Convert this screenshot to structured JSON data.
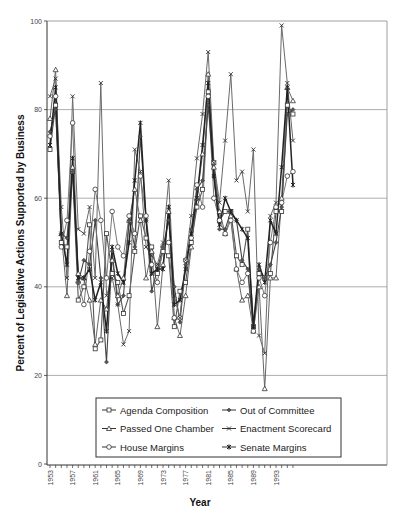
{
  "chart_data": {
    "type": "line",
    "title": "",
    "xlabel": "Year",
    "ylabel": "Percent of Legislative Actions Supported by Business",
    "ylim": [
      0,
      100
    ],
    "yticks": [
      0,
      20,
      40,
      60,
      80,
      100
    ],
    "xtick_labels": [
      "1953",
      "1957",
      "1961",
      "1965",
      "1969",
      "1973",
      "1977",
      "1981",
      "1985",
      "1989",
      "1993"
    ],
    "grid": "horizontal",
    "legend_position": "lower center inside",
    "x": [
      1953,
      1954,
      1955,
      1956,
      1957,
      1958,
      1959,
      1960,
      1961,
      1962,
      1963,
      1964,
      1965,
      1966,
      1967,
      1968,
      1969,
      1970,
      1971,
      1972,
      1973,
      1974,
      1975,
      1976,
      1977,
      1978,
      1979,
      1980,
      1981,
      1982,
      1983,
      1984,
      1985,
      1986,
      1987,
      1988,
      1989,
      1990,
      1991,
      1992,
      1993,
      1994,
      1995,
      1996
    ],
    "series": [
      {
        "name": "Agenda Composition",
        "marker": "square",
        "values": [
          71,
          81,
          50,
          49,
          66,
          37,
          40,
          54,
          26,
          28,
          52,
          43,
          41,
          34,
          38,
          48,
          56,
          51,
          49,
          43,
          48,
          47,
          31,
          39,
          41,
          50,
          58,
          62,
          84,
          68,
          55,
          57,
          57,
          47,
          45,
          53,
          31,
          43,
          42,
          43,
          57,
          57,
          81,
          79
        ]
      },
      {
        "name": "Passed One Chamber",
        "marker": "triangle",
        "values": [
          78,
          89,
          52,
          38,
          67,
          43,
          42,
          37,
          27,
          37,
          35,
          46,
          38,
          42,
          55,
          62,
          55,
          42,
          48,
          31,
          45,
          57,
          33,
          29,
          38,
          49,
          60,
          70,
          88,
          67,
          57,
          52,
          56,
          44,
          37,
          38,
          30,
          40,
          17,
          42,
          42,
          60,
          85,
          82
        ]
      },
      {
        "name": "House Margins",
        "marker": "circle",
        "values": [
          74,
          83,
          49,
          55,
          77,
          41,
          36,
          48,
          62,
          55,
          42,
          57,
          49,
          47,
          56,
          52,
          65,
          56,
          45,
          41,
          49,
          50,
          33,
          33,
          46,
          51,
          63,
          58,
          83,
          60,
          55,
          52,
          55,
          44,
          41,
          43,
          30,
          42,
          38,
          50,
          58,
          59,
          65,
          66
        ]
      },
      {
        "name": "Out of Committee",
        "marker": "diamond",
        "values": [
          75,
          80,
          52,
          51,
          66,
          41,
          46,
          45,
          55,
          42,
          23,
          48,
          36,
          38,
          55,
          49,
          74,
          55,
          39,
          44,
          49,
          55,
          40,
          32,
          45,
          53,
          62,
          64,
          81,
          65,
          53,
          53,
          57,
          55,
          46,
          44,
          31,
          44,
          42,
          45,
          50,
          58,
          79,
          80
        ]
      },
      {
        "name": "Enactment Scorecard",
        "marker": "x",
        "values": [
          83,
          87,
          58,
          42,
          83,
          53,
          52,
          58,
          42,
          86,
          38,
          42,
          36,
          27,
          30,
          71,
          66,
          49,
          47,
          45,
          50,
          64,
          38,
          33,
          46,
          56,
          69,
          79,
          93,
          68,
          59,
          73,
          88,
          64,
          66,
          57,
          71,
          29,
          25,
          56,
          59,
          99,
          86,
          73
        ]
      },
      {
        "name": "Senate Margins",
        "marker": "star",
        "values": [
          72,
          85,
          52,
          45,
          69,
          42,
          42,
          44,
          37,
          41,
          30,
          49,
          43,
          41,
          50,
          64,
          77,
          55,
          43,
          44,
          44,
          58,
          36,
          37,
          44,
          52,
          60,
          72,
          86,
          65,
          54,
          60,
          57,
          55,
          53,
          51,
          31,
          45,
          41,
          55,
          52,
          67,
          85,
          63
        ]
      }
    ]
  },
  "legend": {
    "items": [
      {
        "label": "Agenda Composition"
      },
      {
        "label": "Out of Committee"
      },
      {
        "label": "Passed One Chamber"
      },
      {
        "label": "Enactment Scorecard"
      },
      {
        "label": "House Margins"
      },
      {
        "label": "Senate Margins"
      }
    ]
  },
  "axes": {
    "x_title": "Year",
    "y_title": "Percent of Legislative Actions Supported by Business",
    "y_tick_labels": [
      "0",
      "20",
      "40",
      "60",
      "80",
      "100"
    ],
    "x_tick_labels": [
      "1953",
      "1957",
      "1961",
      "1965",
      "1969",
      "1973",
      "1977",
      "1981",
      "1985",
      "1989",
      "1993"
    ]
  }
}
